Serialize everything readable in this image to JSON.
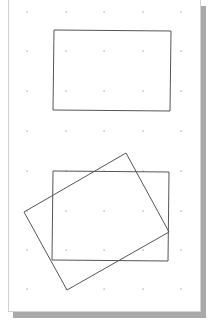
{
  "page": {
    "x": 8,
    "y": 0,
    "width": 193,
    "height": 312,
    "shadow_color": "#a9a9a9",
    "shadow_offset_x": 5,
    "shadow_offset_y": 6,
    "border_color": "#d2d2d2"
  },
  "grid": {
    "dot_color": "#9a9a9a",
    "xs": [
      27,
      66,
      104,
      143,
      181
    ],
    "ys": [
      12,
      51,
      91,
      131,
      171,
      211,
      250,
      289
    ]
  },
  "shapes": {
    "stroke": "#555555",
    "top_rectangle": {
      "points": "54,30 171,31 170,111 53,110"
    },
    "bottom_rectangle": {
      "points": "53,171 169,172 168,261 52,260"
    },
    "rotated_rectangle": {
      "points": "126,153 169,232 67,290 24,212"
    }
  }
}
